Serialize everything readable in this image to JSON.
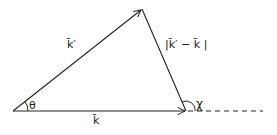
{
  "diagram": {
    "colors": {
      "stroke": "#222222",
      "background": "#ffffff"
    },
    "vertices": {
      "origin": {
        "x": 13,
        "y": 111
      },
      "apex": {
        "x": 142,
        "y": 9
      },
      "right": {
        "x": 186,
        "y": 111
      }
    },
    "vectors": [
      {
        "id": "k_prime",
        "from": "origin",
        "to": "apex",
        "label": "k̄′"
      },
      {
        "id": "k",
        "from": "origin",
        "to": "right",
        "label": "k̄"
      },
      {
        "id": "k_prime_minus_k",
        "from": "apex",
        "to": "right",
        "label": "|k̄′ − k̄ |"
      }
    ],
    "angles": [
      {
        "id": "theta",
        "label": "θ",
        "at": "origin"
      },
      {
        "id": "chi",
        "label": "χ",
        "at": "right"
      }
    ],
    "dashed_extension": {
      "from_x": 186,
      "to_x": 263,
      "y": 111
    }
  }
}
